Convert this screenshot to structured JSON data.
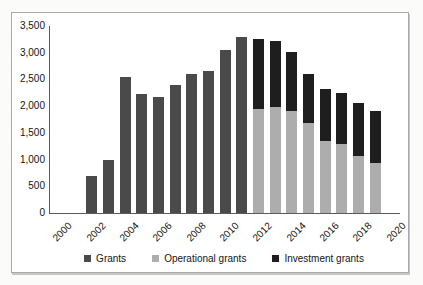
{
  "figure": {
    "background": "#ffffff",
    "border_color": "#a9a9a9"
  },
  "chart_data": {
    "type": "bar",
    "stacked": true,
    "title": "",
    "xlabel": "",
    "ylabel": "",
    "grid": false,
    "legend_position": "bottom",
    "categories": [
      "2000",
      "2001",
      "2002",
      "2003",
      "2004",
      "2005",
      "2006",
      "2007",
      "2008",
      "2009",
      "2010",
      "2011",
      "2012",
      "2013",
      "2014",
      "2015",
      "2016",
      "2017",
      "2018",
      "2019",
      "2020"
    ],
    "x_tick_labels": [
      "2000",
      "2002",
      "2004",
      "2006",
      "2008",
      "2010",
      "2012",
      "2014",
      "2016",
      "2018",
      "2020"
    ],
    "ylim": [
      0,
      3500
    ],
    "y_tick_step": 500,
    "y_tick_labels": [
      "0",
      "500",
      "1,000",
      "1,500",
      "2,000",
      "2,500",
      "3,000",
      "3,500"
    ],
    "series": [
      {
        "name": "Grants",
        "color": "#4a4a4a",
        "values": [
          0,
          0,
          700,
          1000,
          2550,
          2220,
          2180,
          2390,
          2600,
          2650,
          3050,
          3300,
          0,
          0,
          0,
          0,
          0,
          0,
          0,
          0,
          0
        ]
      },
      {
        "name": "Operational grants",
        "color": "#adadad",
        "values": [
          0,
          0,
          0,
          0,
          0,
          0,
          0,
          0,
          0,
          0,
          0,
          0,
          1950,
          1980,
          1910,
          1690,
          1350,
          1300,
          1070,
          940,
          0
        ]
      },
      {
        "name": "Investment grants",
        "color": "#1e1e1e",
        "values": [
          0,
          0,
          0,
          0,
          0,
          0,
          0,
          0,
          0,
          0,
          0,
          0,
          1300,
          1240,
          1110,
          920,
          970,
          950,
          980,
          970,
          0
        ]
      }
    ]
  }
}
